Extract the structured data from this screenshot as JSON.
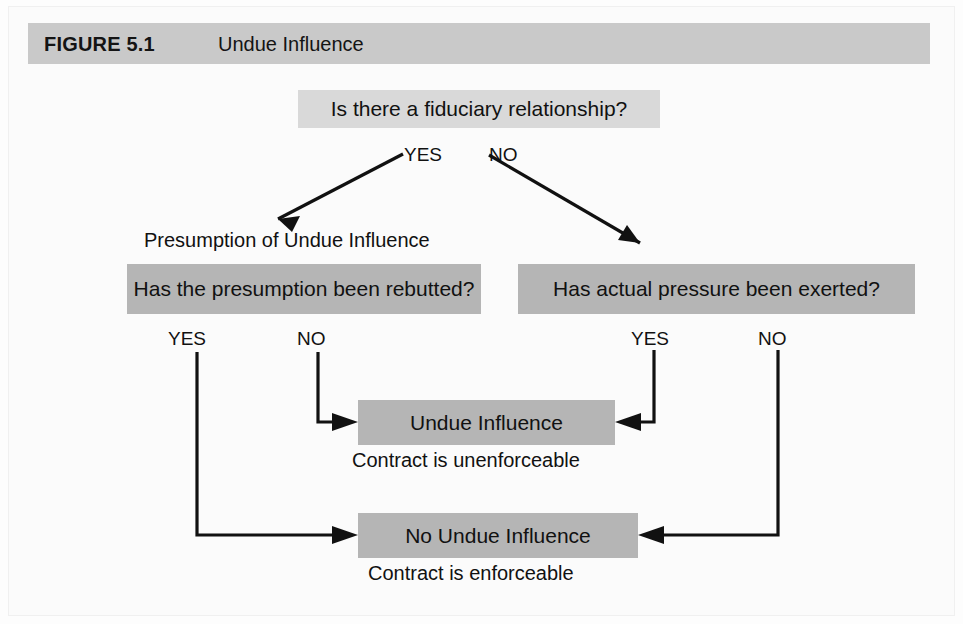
{
  "figure": {
    "label": "FIGURE 5.1",
    "title": "Undue Influence",
    "header_bg": "#c9c9c9",
    "page_bg": "#fbfbfb",
    "node_light_bg": "#d9d9d9",
    "node_mid_bg": "#b5b5b5",
    "ink": "#111111"
  },
  "nodes": {
    "root_question": "Is there a fiduciary relationship?",
    "presumption_caption": "Presumption of Undue Influence",
    "left_question": "Has the presumption been rebutted?",
    "right_question": "Has actual pressure been exerted?",
    "undue_influence": "Undue Influence",
    "undue_influence_caption": "Contract is unenforceable",
    "no_undue_influence": "No Undue Influence",
    "no_undue_influence_caption": "Contract is enforceable"
  },
  "edge_labels": {
    "root_yes": "YES",
    "root_no": "NO",
    "left_yes": "YES",
    "left_no": "NO",
    "right_yes": "YES",
    "right_no": "NO"
  },
  "flow": {
    "type": "decision-flowchart",
    "edges": [
      {
        "from": "root_question",
        "to": "left_question",
        "label": "YES"
      },
      {
        "from": "root_question",
        "to": "right_question",
        "label": "NO"
      },
      {
        "from": "left_question",
        "to": "no_undue_influence",
        "label": "YES"
      },
      {
        "from": "left_question",
        "to": "undue_influence",
        "label": "NO"
      },
      {
        "from": "right_question",
        "to": "undue_influence",
        "label": "YES"
      },
      {
        "from": "right_question",
        "to": "no_undue_influence",
        "label": "NO"
      }
    ]
  }
}
